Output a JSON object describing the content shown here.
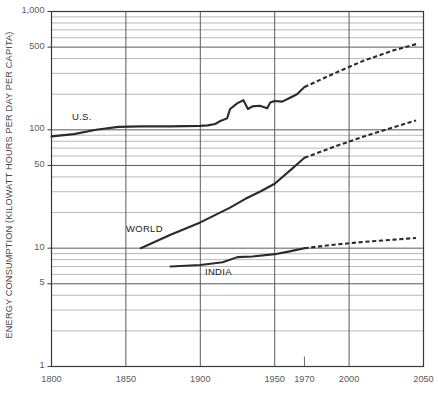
{
  "chart_data": {
    "type": "line",
    "title": "",
    "subtitle": "",
    "xlabel": "",
    "ylabel": "ENERGY CONSUMPTION (KILOWATT HOURS PER DAY PER CAPITA)",
    "yscale": "log",
    "ylim": [
      1,
      1000
    ],
    "xlim": [
      1800,
      2050
    ],
    "grid": true,
    "legend_position": "inline-annotations",
    "y_ticks": [
      {
        "value": 1,
        "label": "1"
      },
      {
        "value": 5,
        "label": "5"
      },
      {
        "value": 10,
        "label": "10"
      },
      {
        "value": 50,
        "label": "50"
      },
      {
        "value": 100,
        "label": "100"
      },
      {
        "value": 500,
        "label": "500"
      },
      {
        "value": 1000,
        "label": "1,000"
      }
    ],
    "y_minor_ticks": [
      2,
      3,
      4,
      6,
      7,
      8,
      9,
      20,
      30,
      40,
      60,
      70,
      80,
      90,
      200,
      300,
      400,
      600,
      700,
      800,
      900
    ],
    "x_ticks": [
      {
        "value": 1800,
        "label": "1800"
      },
      {
        "value": 1850,
        "label": "1850"
      },
      {
        "value": 1900,
        "label": "1900"
      },
      {
        "value": 1950,
        "label": "1950"
      },
      {
        "value": 1970,
        "label": "1970"
      },
      {
        "value": 2000,
        "label": "2000"
      },
      {
        "value": 2050,
        "label": "2050"
      }
    ],
    "series": [
      {
        "name": "U.S.",
        "label": "U.S.",
        "color": "#2b2b2b",
        "solid": {
          "x": [
            1800,
            1815,
            1830,
            1845,
            1860,
            1880,
            1900,
            1905,
            1910,
            1913,
            1918,
            1920,
            1925,
            1929,
            1932,
            1935,
            1940,
            1945,
            1947,
            1950,
            1955,
            1960,
            1965,
            1970
          ],
          "y": [
            88,
            92,
            100,
            106,
            107,
            107,
            108,
            109,
            112,
            118,
            125,
            150,
            168,
            178,
            150,
            158,
            160,
            152,
            170,
            175,
            173,
            186,
            200,
            230
          ]
        },
        "dashed": {
          "x": [
            1970,
            1990,
            2010,
            2030,
            2045
          ],
          "y": [
            230,
            300,
            385,
            470,
            530
          ]
        }
      },
      {
        "name": "WORLD",
        "label": "WORLD",
        "color": "#2b2b2b",
        "solid": {
          "x": [
            1860,
            1880,
            1900,
            1920,
            1930,
            1940,
            1950,
            1960,
            1970
          ],
          "y": [
            10.0,
            13.0,
            16.5,
            22.0,
            26.0,
            30.0,
            35.0,
            45.0,
            58.0
          ]
        },
        "dashed": {
          "x": [
            1970,
            1990,
            2010,
            2030,
            2045
          ],
          "y": [
            58.0,
            72.0,
            88.0,
            105.0,
            120.0
          ]
        }
      },
      {
        "name": "INDIA",
        "label": "INDIA",
        "color": "#2b2b2b",
        "solid": {
          "x": [
            1880,
            1900,
            1915,
            1925,
            1935,
            1950,
            1960,
            1970
          ],
          "y": [
            7.0,
            7.2,
            7.6,
            8.4,
            8.5,
            8.9,
            9.4,
            10.0
          ]
        },
        "dashed": {
          "x": [
            1970,
            1990,
            2010,
            2030,
            2045
          ],
          "y": [
            10.0,
            10.7,
            11.3,
            11.8,
            12.2
          ]
        }
      }
    ],
    "annotations": [
      {
        "text": "U.S.",
        "x_px": 72,
        "y_px": 111
      },
      {
        "text": "WORLD",
        "x_px": 126,
        "y_px": 223
      },
      {
        "text": "INDIA",
        "x_px": 205,
        "y_px": 266
      }
    ],
    "colors": {
      "line": "#2b2b2b",
      "major_grid": "#5a5a5a",
      "minor_grid": "#9a9a9a",
      "axis": "#3a3a3a",
      "text": "#5a5a5a",
      "background": "#ffffff"
    }
  }
}
